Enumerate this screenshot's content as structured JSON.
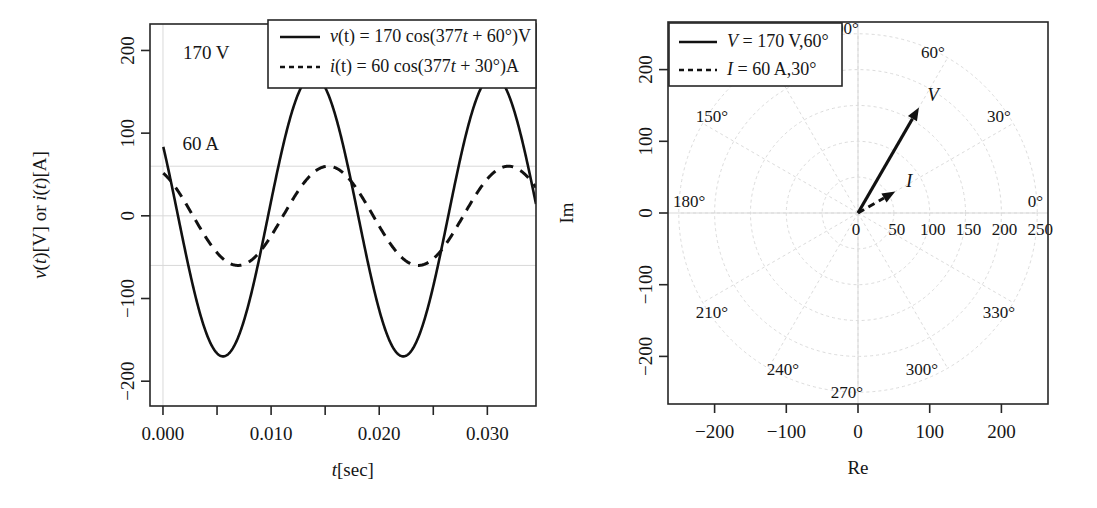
{
  "figure": {
    "panels": [
      "time-domain-waveform",
      "phasor-polar-diagram"
    ]
  },
  "chart_data": [
    {
      "type": "line",
      "id": "time-domain",
      "title": "",
      "xlabel": "t[sec]",
      "xlabel_parts": {
        "italic": "t",
        "rest": "[sec]"
      },
      "ylabel": "v(t)[V] or i(t)[A]",
      "xlim": [
        -0.0012,
        0.0345
      ],
      "ylim": [
        -230,
        232
      ],
      "xticks": [
        0.0,
        0.005,
        0.01,
        0.015,
        0.02,
        0.025,
        0.03
      ],
      "xticklabels": [
        "0.000",
        "",
        "0.010",
        "",
        "0.020",
        "",
        "0.030"
      ],
      "yticks": [
        -200,
        -100,
        0,
        100,
        200
      ],
      "yticklabels": [
        "-200",
        "-100",
        "0",
        "100",
        "200"
      ],
      "grid": true,
      "gridlines_y": [
        60,
        0,
        -60
      ],
      "gridline_x": 0.0,
      "series": [
        {
          "name": "v",
          "label": "v(t) = 170 cos(377t + 60°)V",
          "style": "solid",
          "amplitude": 170,
          "omega": 377,
          "phase_deg": 60,
          "unit": "V"
        },
        {
          "name": "i",
          "label": "i(t) = 60 cos(377t + 30°)A",
          "style": "dashed",
          "amplitude": 60,
          "omega": 377,
          "phase_deg": 30,
          "unit": "A"
        }
      ],
      "annotations": [
        {
          "text": "170 V",
          "x": 0.004,
          "y": 190
        },
        {
          "text": "60 A",
          "x": 0.0035,
          "y": 80
        }
      ],
      "legend": {
        "position": "top-right",
        "entries": [
          {
            "style": "solid",
            "label": "v(t) = 170 cos(377t + 60°)V"
          },
          {
            "style": "dashed",
            "label": "i(t) = 60 cos(377t + 30°)A"
          }
        ]
      }
    },
    {
      "type": "polar",
      "id": "phasor-diagram",
      "title": "",
      "xlabel": "Re",
      "ylabel": "Im",
      "xlim": [
        -265,
        265
      ],
      "ylim": [
        -265,
        265
      ],
      "xticks": [
        -200,
        -100,
        0,
        100,
        200
      ],
      "xticklabels": [
        "-200",
        "-100",
        "0",
        "100",
        "200"
      ],
      "yticks": [
        -200,
        -100,
        0,
        100,
        200
      ],
      "yticklabels": [
        "-200",
        "-100",
        "0",
        "100",
        "200"
      ],
      "radial_ticks": [
        0,
        50,
        100,
        150,
        200,
        250
      ],
      "radial_ticklabels": [
        "0",
        "50",
        "100",
        "150",
        "200",
        "250"
      ],
      "angle_ticks_deg": [
        0,
        30,
        60,
        90,
        120,
        150,
        180,
        210,
        240,
        270,
        300,
        330
      ],
      "angle_labels": [
        "0°",
        "30°",
        "60°",
        "90°",
        "150°",
        "180°",
        "210°",
        "240°",
        "270°",
        "300°",
        "330°"
      ],
      "grid": true,
      "phasors": [
        {
          "name": "V",
          "label": "V",
          "legend_label": "V = 170 V,60°",
          "magnitude": 170,
          "angle_deg": 60,
          "style": "solid"
        },
        {
          "name": "I",
          "label": "I",
          "legend_label": "I = 60 A,30°",
          "magnitude": 60,
          "angle_deg": 30,
          "style": "dashed"
        }
      ],
      "legend": {
        "position": "top-left",
        "entries": [
          {
            "style": "solid",
            "label": "V = 170 V,60°"
          },
          {
            "style": "dashed",
            "label": "I = 60 A,30°"
          }
        ]
      }
    }
  ]
}
